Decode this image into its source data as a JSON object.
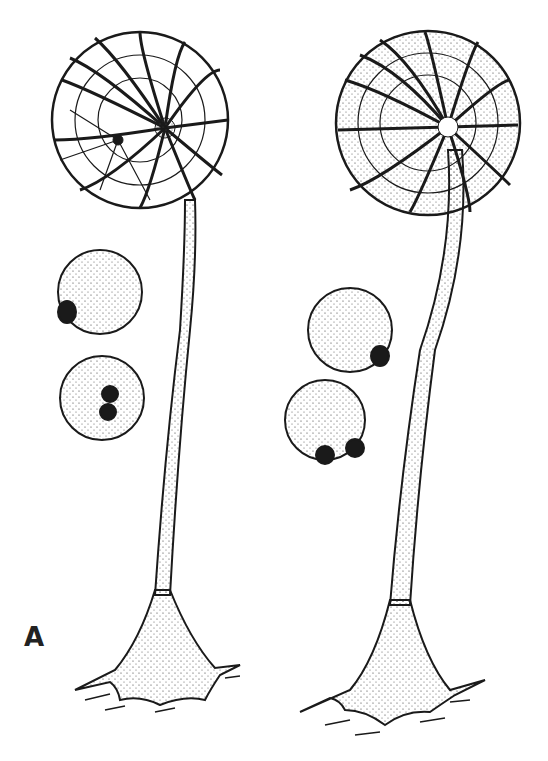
{
  "figure": {
    "panel_label": "A",
    "subjects": [
      {
        "name": "sporangium-left",
        "style": "open net capsule on tall stalk"
      },
      {
        "name": "sporangium-right",
        "style": "stippled capsule with ribs on tall stalk"
      }
    ],
    "spores_left": [
      {
        "cx": 100,
        "cy": 292,
        "r": 42,
        "dots": [
          [
            67,
            312
          ]
        ]
      },
      {
        "cx": 102,
        "cy": 398,
        "r": 42,
        "dots": [
          [
            110,
            394
          ],
          [
            108,
            412
          ]
        ]
      }
    ],
    "spores_right": [
      {
        "cx": 350,
        "cy": 330,
        "r": 42,
        "dots": [
          [
            380,
            356
          ]
        ]
      },
      {
        "cx": 325,
        "cy": 420,
        "r": 40,
        "dots": [
          [
            325,
            455
          ],
          [
            355,
            448
          ]
        ]
      }
    ],
    "colors": {
      "ink": "#1a1a1a",
      "paper": "#ffffff"
    }
  }
}
